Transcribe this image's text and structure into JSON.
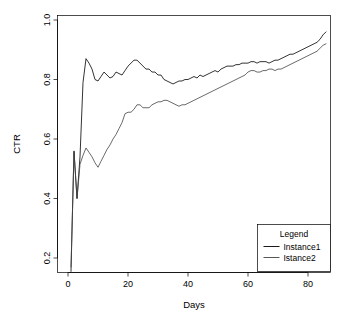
{
  "chart_data": {
    "type": "line",
    "title": "",
    "xlabel": "Days",
    "ylabel": "CTR",
    "xlim": [
      0,
      87
    ],
    "ylim": [
      0.15,
      1.03
    ],
    "grid": false,
    "legend": {
      "title": "Legend",
      "position": "bottom-right",
      "entries": [
        "Instance1",
        "Istance2"
      ]
    },
    "xticks": [
      0,
      20,
      40,
      60,
      80
    ],
    "xtick_labels": [
      "0",
      "20",
      "40",
      "60",
      "80"
    ],
    "yticks": [
      0.2,
      0.4,
      0.6,
      0.8,
      1.0
    ],
    "ytick_labels": [
      "0.2",
      "0.4",
      "0.6",
      "0.8",
      "1.0"
    ],
    "x": [
      1,
      2,
      3,
      4,
      5,
      6,
      7,
      8,
      9,
      10,
      11,
      12,
      13,
      14,
      15,
      16,
      17,
      18,
      19,
      20,
      21,
      22,
      23,
      24,
      25,
      26,
      27,
      28,
      29,
      30,
      31,
      32,
      33,
      34,
      35,
      36,
      37,
      38,
      39,
      40,
      41,
      42,
      43,
      44,
      45,
      46,
      47,
      48,
      49,
      50,
      51,
      52,
      53,
      54,
      55,
      56,
      57,
      58,
      59,
      60,
      61,
      62,
      63,
      64,
      65,
      66,
      67,
      68,
      69,
      70,
      71,
      72,
      73,
      74,
      75,
      76,
      77,
      78,
      79,
      80,
      81,
      82,
      83,
      84,
      85,
      86
    ],
    "series": [
      {
        "name": "Instance1",
        "color": "#000000",
        "values": [
          0.155,
          0.56,
          0.4,
          0.54,
          0.79,
          0.87,
          0.855,
          0.835,
          0.8,
          0.795,
          0.81,
          0.825,
          0.815,
          0.805,
          0.81,
          0.825,
          0.82,
          0.815,
          0.83,
          0.845,
          0.855,
          0.865,
          0.865,
          0.855,
          0.845,
          0.835,
          0.835,
          0.825,
          0.825,
          0.815,
          0.815,
          0.8,
          0.795,
          0.79,
          0.785,
          0.79,
          0.795,
          0.795,
          0.8,
          0.8,
          0.805,
          0.81,
          0.805,
          0.815,
          0.81,
          0.815,
          0.82,
          0.825,
          0.83,
          0.825,
          0.835,
          0.84,
          0.845,
          0.845,
          0.845,
          0.85,
          0.85,
          0.855,
          0.855,
          0.855,
          0.86,
          0.86,
          0.855,
          0.86,
          0.86,
          0.86,
          0.855,
          0.86,
          0.865,
          0.865,
          0.87,
          0.875,
          0.88,
          0.885,
          0.885,
          0.89,
          0.895,
          0.9,
          0.905,
          0.91,
          0.915,
          0.92,
          0.925,
          0.935,
          0.95,
          0.96
        ]
      },
      {
        "name": "Istance2",
        "color": "#444444",
        "values": [
          0.17,
          0.555,
          0.4,
          0.515,
          0.545,
          0.57,
          0.555,
          0.54,
          0.52,
          0.505,
          0.525,
          0.545,
          0.565,
          0.58,
          0.6,
          0.615,
          0.635,
          0.655,
          0.685,
          0.69,
          0.69,
          0.7,
          0.715,
          0.715,
          0.705,
          0.705,
          0.705,
          0.715,
          0.72,
          0.725,
          0.725,
          0.73,
          0.73,
          0.725,
          0.72,
          0.715,
          0.71,
          0.715,
          0.715,
          0.72,
          0.725,
          0.73,
          0.735,
          0.74,
          0.745,
          0.75,
          0.755,
          0.76,
          0.765,
          0.77,
          0.775,
          0.78,
          0.785,
          0.79,
          0.795,
          0.8,
          0.805,
          0.81,
          0.815,
          0.825,
          0.83,
          0.83,
          0.825,
          0.825,
          0.83,
          0.83,
          0.835,
          0.835,
          0.83,
          0.835,
          0.835,
          0.84,
          0.845,
          0.85,
          0.855,
          0.86,
          0.865,
          0.87,
          0.875,
          0.88,
          0.885,
          0.89,
          0.895,
          0.905,
          0.915,
          0.92
        ]
      }
    ]
  }
}
